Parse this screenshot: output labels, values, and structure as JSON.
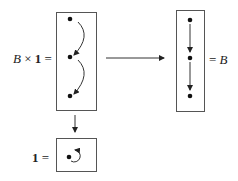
{
  "labels": {
    "lhs_var": "B",
    "lhs_op": " × ",
    "lhs_one": "1",
    "lhs_eq": " =",
    "rhs_eq": "= ",
    "rhs_var": "B",
    "identity_one": "1",
    "identity_eq": " ="
  },
  "diagram": {
    "nodes": {
      "product_box": [
        "top",
        "middle",
        "bottom"
      ],
      "result_box": [
        "top",
        "middle",
        "bottom"
      ],
      "identity_box": [
        "object"
      ]
    },
    "edges": [
      {
        "from": "product_box",
        "to": "result_box",
        "type": "functor-arrow"
      },
      {
        "from": "product_box",
        "to": "identity_box",
        "type": "projection-arrow"
      },
      {
        "from": "product_box.top",
        "to": "product_box.middle",
        "type": "curved"
      },
      {
        "from": "product_box.middle",
        "to": "product_box.bottom",
        "type": "curved"
      },
      {
        "from": "result_box.top",
        "to": "result_box.middle",
        "type": "straight"
      },
      {
        "from": "result_box.middle",
        "to": "result_box.bottom",
        "type": "straight"
      },
      {
        "from": "identity_box.object",
        "to": "identity_box.object",
        "type": "self-loop"
      }
    ]
  },
  "colors": {
    "stroke": "#333333",
    "box": "#555555",
    "dot": "#111111"
  }
}
